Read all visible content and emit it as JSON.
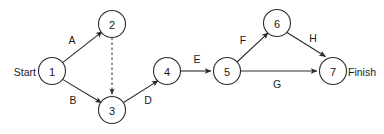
{
  "diagram": {
    "type": "directed-graph",
    "colors": {
      "stroke": "#2b2b2b",
      "text": "#1a1a1a",
      "background": "#ffffff"
    },
    "terminals": {
      "start_label": "Start",
      "finish_label": "Finish"
    },
    "nodes": [
      {
        "id": "1",
        "label": "1",
        "cx": 52,
        "cy": 71,
        "r": 13.5
      },
      {
        "id": "2",
        "label": "2",
        "cx": 112,
        "cy": 24,
        "r": 13.5
      },
      {
        "id": "3",
        "label": "3",
        "cx": 112,
        "cy": 110,
        "r": 13.5
      },
      {
        "id": "4",
        "label": "4",
        "cx": 167,
        "cy": 71,
        "r": 13.5
      },
      {
        "id": "5",
        "label": "5",
        "cx": 227,
        "cy": 71,
        "r": 13.5
      },
      {
        "id": "6",
        "label": "6",
        "cx": 277,
        "cy": 23,
        "r": 13.5
      },
      {
        "id": "7",
        "label": "7",
        "cx": 333,
        "cy": 71,
        "r": 13.5
      }
    ],
    "edges": [
      {
        "id": "edge-A",
        "label": "A",
        "from": "1",
        "to": "2",
        "style": "solid",
        "lx": 72,
        "ly": 40
      },
      {
        "id": "edge-B",
        "label": "B",
        "from": "1",
        "to": "3",
        "style": "solid",
        "lx": 73,
        "ly": 100
      },
      {
        "id": "edge-dummy",
        "label": "",
        "from": "2",
        "to": "3",
        "style": "dashed",
        "lx": 112,
        "ly": 67
      },
      {
        "id": "edge-D",
        "label": "D",
        "from": "3",
        "to": "4",
        "style": "solid",
        "lx": 148,
        "ly": 100
      },
      {
        "id": "edge-E",
        "label": "E",
        "from": "4",
        "to": "5",
        "style": "solid",
        "lx": 197,
        "ly": 59
      },
      {
        "id": "edge-F",
        "label": "F",
        "from": "5",
        "to": "6",
        "style": "solid",
        "lx": 243,
        "ly": 40
      },
      {
        "id": "edge-G",
        "label": "G",
        "from": "5",
        "to": "7",
        "style": "solid",
        "lx": 277,
        "ly": 84
      },
      {
        "id": "edge-H",
        "label": "H",
        "from": "6",
        "to": "7",
        "style": "solid",
        "lx": 313,
        "ly": 38
      }
    ]
  }
}
